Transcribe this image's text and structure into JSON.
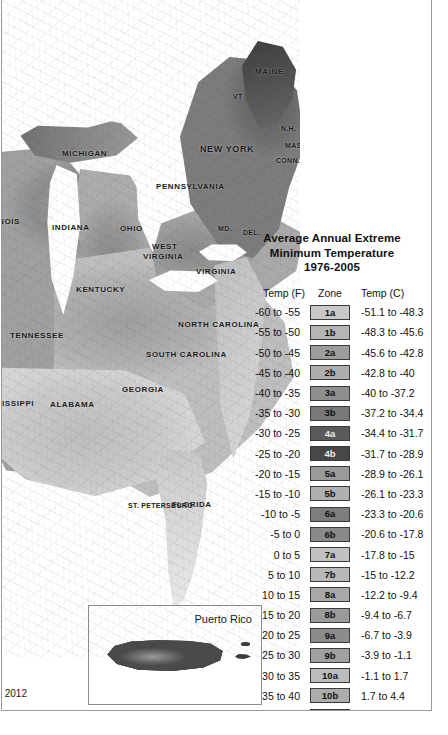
{
  "frame": {
    "present": true
  },
  "map": {
    "name": "plant-hardiness-zone-map-eastern-us",
    "state_labels": [
      {
        "text": "MICHIGAN",
        "x": 62,
        "y": 152,
        "size": "md"
      },
      {
        "text": "NEW YORK",
        "x": 200,
        "y": 147,
        "size": "lg"
      },
      {
        "text": "PENNSYLVANIA",
        "x": 156,
        "y": 185,
        "size": "md"
      },
      {
        "text": "MAINE",
        "x": 255,
        "y": 70,
        "size": "md"
      },
      {
        "text": "VT",
        "x": 233,
        "y": 96,
        "size": "sm"
      },
      {
        "text": "N.H.",
        "x": 281,
        "y": 128,
        "size": "sm"
      },
      {
        "text": "MASS.",
        "x": 285,
        "y": 145,
        "size": "sm"
      },
      {
        "text": "CONN.",
        "x": 276,
        "y": 160,
        "size": "sm"
      },
      {
        "text": "R.I.",
        "x": 308,
        "y": 158,
        "size": "sm"
      },
      {
        "text": "OHIO",
        "x": 120,
        "y": 227,
        "size": "md"
      },
      {
        "text": "INDIANA",
        "x": 52,
        "y": 226,
        "size": "md"
      },
      {
        "text": "NOIS",
        "x": -2,
        "y": 220,
        "size": "md"
      },
      {
        "text": "WEST",
        "x": 152,
        "y": 245,
        "size": "md"
      },
      {
        "text": "VIRGINIA",
        "x": 143,
        "y": 255,
        "size": "md"
      },
      {
        "text": "MD.",
        "x": 218,
        "y": 228,
        "size": "sm"
      },
      {
        "text": "DEL.",
        "x": 243,
        "y": 232,
        "size": "sm"
      },
      {
        "text": "VIRGINIA",
        "x": 196,
        "y": 270,
        "size": "md"
      },
      {
        "text": "KENTUCKY",
        "x": 76,
        "y": 288,
        "size": "md"
      },
      {
        "text": "TENNESSEE",
        "x": 10,
        "y": 334,
        "size": "md"
      },
      {
        "text": "NORTH CAROLINA",
        "x": 178,
        "y": 323,
        "size": "md"
      },
      {
        "text": "SOUTH CAROLINA",
        "x": 146,
        "y": 353,
        "size": "md"
      },
      {
        "text": "GEORGIA",
        "x": 122,
        "y": 388,
        "size": "md"
      },
      {
        "text": "ALABAMA",
        "x": 50,
        "y": 403,
        "size": "md"
      },
      {
        "text": "SISSIPPI",
        "x": -4,
        "y": 402,
        "size": "md"
      },
      {
        "text": "FLORIDA",
        "x": 172,
        "y": 503,
        "size": "md"
      },
      {
        "text": "ST. PETERSBURG",
        "x": 128,
        "y": 505,
        "size": "sm"
      }
    ]
  },
  "legend": {
    "title_line1": "Average Annual Extreme",
    "title_line2": "Minimum Temperature",
    "title_line3": "1976-2005",
    "headers": {
      "f": "Temp (F)",
      "zone": "Zone",
      "c": "Temp (C)"
    },
    "rows": [
      {
        "f": "-60 to -55",
        "zone": "1a",
        "c": "-51.1 to -48.3",
        "bg": "#c8c8c8",
        "fg": "#111111"
      },
      {
        "f": "-55 to -50",
        "zone": "1b",
        "c": "-48.3 to -45.6",
        "bg": "#b5b5b5",
        "fg": "#111111"
      },
      {
        "f": "-50 to -45",
        "zone": "2a",
        "c": "-45.6 to -42.8",
        "bg": "#9d9d9d",
        "fg": "#111111"
      },
      {
        "f": "-45 to -40",
        "zone": "2b",
        "c": "-42.8 to -40",
        "bg": "#aeaeae",
        "fg": "#111111"
      },
      {
        "f": "-40 to -35",
        "zone": "3a",
        "c": "-40 to -37.2",
        "bg": "#8e8e8e",
        "fg": "#111111"
      },
      {
        "f": "-35 to -30",
        "zone": "3b",
        "c": "-37.2 to -34.4",
        "bg": "#797979",
        "fg": "#111111"
      },
      {
        "f": "-30 to -25",
        "zone": "4a",
        "c": "-34.4 to -31.7",
        "bg": "#5a5a5a",
        "fg": "#eeeeee"
      },
      {
        "f": "-25 to -20",
        "zone": "4b",
        "c": "-31.7 to -28.9",
        "bg": "#474747",
        "fg": "#eeeeee"
      },
      {
        "f": "-20 to -15",
        "zone": "5a",
        "c": "-28.9 to -26.1",
        "bg": "#9a9a9a",
        "fg": "#111111"
      },
      {
        "f": "-15 to -10",
        "zone": "5b",
        "c": "-26.1 to -23.3",
        "bg": "#b0b0b0",
        "fg": "#111111"
      },
      {
        "f": "-10 to -5",
        "zone": "6a",
        "c": "-23.3 to -20.6",
        "bg": "#7d7d7d",
        "fg": "#111111"
      },
      {
        "f": "-5 to 0",
        "zone": "6b",
        "c": "-20.6 to -17.8",
        "bg": "#8a8a8a",
        "fg": "#111111"
      },
      {
        "f": "0 to 5",
        "zone": "7a",
        "c": "-17.8 to -15",
        "bg": "#c2c2c2",
        "fg": "#111111"
      },
      {
        "f": "5 to 10",
        "zone": "7b",
        "c": "-15 to -12.2",
        "bg": "#b8b8b8",
        "fg": "#111111"
      },
      {
        "f": "10 to 15",
        "zone": "8a",
        "c": "-12.2 to -9.4",
        "bg": "#a9a9a9",
        "fg": "#111111"
      },
      {
        "f": "15 to 20",
        "zone": "8b",
        "c": "-9.4 to -6.7",
        "bg": "#9b9b9b",
        "fg": "#111111"
      },
      {
        "f": "20 to 25",
        "zone": "9a",
        "c": "-6.7 to -3.9",
        "bg": "#8c8c8c",
        "fg": "#111111"
      },
      {
        "f": "25 to 30",
        "zone": "9b",
        "c": "-3.9 to -1.1",
        "bg": "#a0a0a0",
        "fg": "#111111"
      },
      {
        "f": "30 to 35",
        "zone": "10a",
        "c": "-1.1 to 1.7",
        "bg": "#bcbcbc",
        "fg": "#111111"
      },
      {
        "f": "35 to 40",
        "zone": "10b",
        "c": "1.7 to 4.4",
        "bg": "#adadad",
        "fg": "#111111"
      },
      {
        "f": "40 to 45",
        "zone": "11a",
        "c": "4.4 to 7.2",
        "bg": "#9e9e9e",
        "fg": "#111111"
      },
      {
        "f": "45 to 50",
        "zone": "11b",
        "c": "7.2 to 10",
        "bg": "#b2b2b2",
        "fg": "#111111"
      },
      {
        "f": "50 to 55",
        "zone": "12a",
        "c": "10 to 12.8",
        "bg": "#6c6c6c",
        "fg": "#111111"
      },
      {
        "f": "55 to 60",
        "zone": "12b",
        "c": "12.8 to 15.6",
        "bg": "#515151",
        "fg": "#e8e8e8"
      },
      {
        "f": "60 to 65",
        "zone": "13a",
        "c": "15.6 to 18.3",
        "bg": "#333333",
        "fg": "#d8d8d8"
      },
      {
        "f": "65 to 70",
        "zone": "13b",
        "c": "18.3 to 21.1",
        "bg": "#141414",
        "fg": "#bdbdbd"
      }
    ]
  },
  "inset": {
    "title": "Puerto Rico"
  },
  "credit": {
    "line1": "oup,",
    "line2": "ersity,",
    "line3": "state.edu, 2012"
  }
}
